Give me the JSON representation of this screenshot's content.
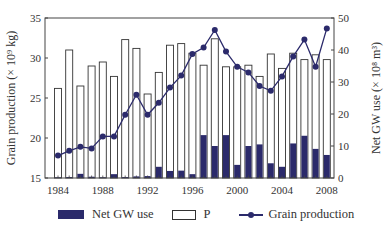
{
  "chart_data": {
    "type": "bar+line",
    "title": "",
    "xlabel": "",
    "x": [
      1984,
      1985,
      1986,
      1987,
      1988,
      1989,
      1990,
      1991,
      1992,
      1993,
      1994,
      1995,
      1996,
      1997,
      1998,
      1999,
      2000,
      2001,
      2002,
      2003,
      2004,
      2005,
      2006,
      2007,
      2008
    ],
    "x_tick_labels": [
      "1984",
      "1988",
      "1992",
      "1996",
      "2000",
      "2004",
      "2008"
    ],
    "left_axis": {
      "label": "Grain production (× 10⁹ kg)",
      "ylim": [
        15,
        35
      ],
      "ticks": [
        15,
        20,
        25,
        30,
        35
      ]
    },
    "right_axis": {
      "label": "Net GW use (× 10⁸ m³)",
      "ylim": [
        0,
        50
      ],
      "ticks": [
        0,
        10,
        20,
        30,
        40,
        50
      ]
    },
    "series": [
      {
        "name": "Net GW use",
        "type": "bar",
        "axis": "right",
        "color": "#2b2a6b",
        "values": [
          0.2,
          0.3,
          1.3,
          0.4,
          0.2,
          1.2,
          0.3,
          0.5,
          0.6,
          3.5,
          2.2,
          2.3,
          1.2,
          13.4,
          10.0,
          13.4,
          4.1,
          10.0,
          10.5,
          4.6,
          3.5,
          10.8,
          13.2,
          9.1,
          7.2
        ]
      },
      {
        "name": "P",
        "type": "bar",
        "axis": "left",
        "color": "#ffffff",
        "edge": "#333333",
        "values": [
          26.2,
          31.0,
          26.5,
          29.0,
          29.5,
          27.7,
          32.3,
          31.2,
          25.5,
          28.2,
          31.6,
          31.8,
          30.6,
          29.1,
          32.4,
          28.9,
          28.9,
          29.1,
          27.7,
          30.5,
          28.7,
          30.6,
          29.8,
          30.4,
          29.8
        ]
      },
      {
        "name": "Grain production",
        "type": "line",
        "axis": "left",
        "color": "#2b2a6b",
        "values": [
          17.8,
          18.4,
          18.9,
          18.7,
          20.2,
          20.2,
          22.9,
          25.4,
          22.9,
          24.4,
          26.3,
          27.8,
          30.5,
          31.3,
          33.5,
          30.8,
          28.9,
          28.2,
          26.5,
          25.9,
          27.7,
          30.2,
          32.3,
          28.9,
          33.7
        ]
      }
    ],
    "legend_position": "bottom",
    "grid": false
  },
  "legend": {
    "gw_label": "Net GW use",
    "p_label": "P",
    "grain_label": "Grain production"
  },
  "axes": {
    "left_title": "Grain production (× 10⁹ kg)",
    "right_title": "Net GW use (× 10⁸ m³)"
  }
}
